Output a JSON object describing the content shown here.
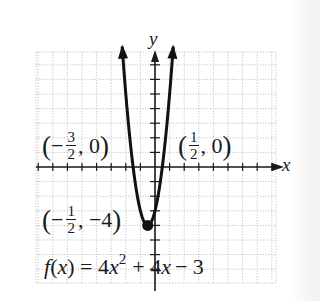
{
  "chart_data": {
    "type": "line",
    "title": "",
    "xlabel": "x",
    "ylabel": "y",
    "xlim": [
      -8,
      8
    ],
    "ylim": [
      -8,
      8
    ],
    "grid": true,
    "grid_step": 1,
    "function": "f(x) = 4x^2 + 4x - 3",
    "series": [
      {
        "name": "f(x) = 4x^2 + 4x - 3",
        "x": [
          -2.25,
          -2.0,
          -1.75,
          -1.5,
          -1.25,
          -1.0,
          -0.75,
          -0.5,
          -0.25,
          0.0,
          0.25,
          0.5,
          0.75,
          1.0,
          1.25
        ],
        "y": [
          8.25,
          5.0,
          2.25,
          0.0,
          -1.75,
          -3.0,
          -3.75,
          -4.0,
          -3.75,
          -3.0,
          -1.75,
          0.0,
          2.25,
          5.0,
          8.25
        ]
      }
    ],
    "points": [
      {
        "label": "(-3/2, 0)",
        "x": -1.5,
        "y": 0,
        "role": "x-intercept"
      },
      {
        "label": "(1/2, 0)",
        "x": 0.5,
        "y": 0,
        "role": "x-intercept"
      },
      {
        "label": "(-1/2, -4)",
        "x": -0.5,
        "y": -4,
        "role": "vertex",
        "marker": "filled-circle"
      }
    ],
    "annotations": [
      "(-3/2, 0)",
      "(1/2, 0)",
      "(-1/2, -4)",
      "f(x) = 4x^2 + 4x - 3"
    ]
  },
  "labels": {
    "x_axis": "x",
    "y_axis": "y",
    "left_intercept": {
      "sign": "−",
      "num": "3",
      "den": "2",
      "y": "0"
    },
    "right_intercept": {
      "sign": "",
      "num": "1",
      "den": "2",
      "y": "0"
    },
    "vertex": {
      "sign": "−",
      "num": "1",
      "den": "2",
      "y": "−4"
    },
    "equation": {
      "lhs": "f",
      "arg": "x",
      "coef_a": "4",
      "var": "x",
      "exp": "2",
      "rest": "+ 4",
      "var2": "x",
      "const": "− 3"
    }
  },
  "colors": {
    "curve": "#111111",
    "axis": "#1a1a1a",
    "grid": "#b5b5b5",
    "background": "#ffffff"
  }
}
